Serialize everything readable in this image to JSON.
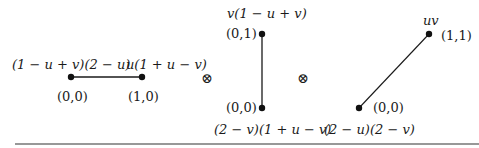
{
  "diagram": {
    "operator": "⊗",
    "factors": [
      {
        "name": "horizontal-edge",
        "vertices": [
          {
            "coord": "(0,0)",
            "weight": "(1 − u + v)(2 − u)"
          },
          {
            "coord": "(1,0)",
            "weight": "u(1 + u − v)"
          }
        ]
      },
      {
        "name": "vertical-edge",
        "vertices": [
          {
            "coord": "(0,1)",
            "weight": "v(1 − u + v)"
          },
          {
            "coord": "(0,0)",
            "weight": "(2 − v)(1 + u − v)"
          }
        ]
      },
      {
        "name": "diagonal-edge",
        "vertices": [
          {
            "coord": "(1,1)",
            "weight": "uv"
          },
          {
            "coord": "(0,0)",
            "weight": "(2 − u)(2 − v)"
          }
        ]
      }
    ]
  }
}
